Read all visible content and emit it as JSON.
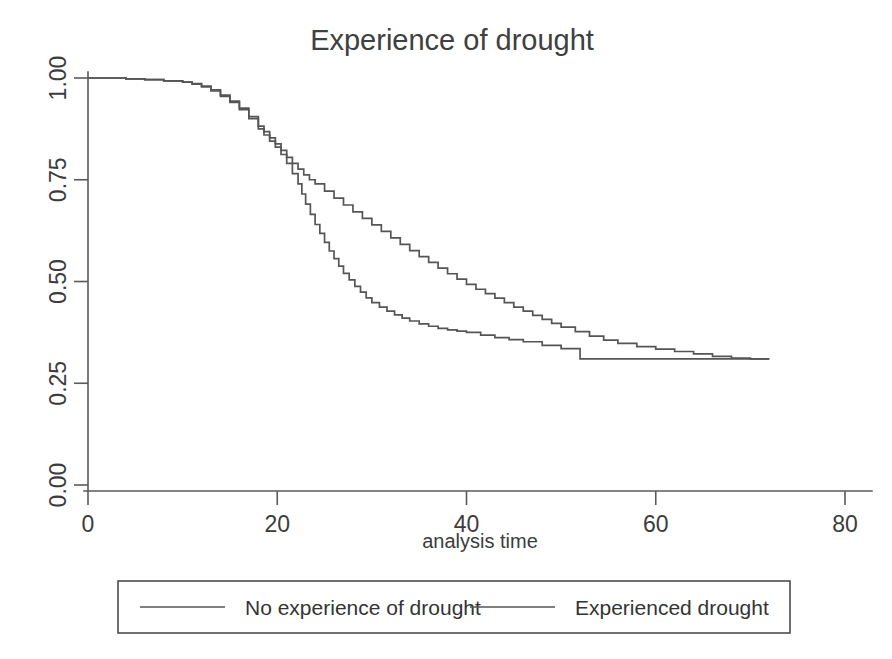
{
  "chart_data": {
    "type": "line",
    "subtype": "kaplan-meier-step",
    "title": "Experience of drought",
    "xlabel": "analysis time",
    "ylabel": "",
    "xlim": [
      0,
      80
    ],
    "ylim": [
      0,
      1.0
    ],
    "xticks": [
      0,
      20,
      40,
      60,
      80
    ],
    "xticklabels": [
      "0",
      "20",
      "40",
      "60",
      "80"
    ],
    "yticks": [
      0.0,
      0.25,
      0.5,
      0.75,
      1.0
    ],
    "yticklabels": [
      "0.00",
      "0.25",
      "0.50",
      "0.75",
      "1.00"
    ],
    "grid": false,
    "legend_position": "below-axes",
    "line_color": "#555555",
    "background_color": "#ffffff",
    "series": [
      {
        "name": "No experience of drought",
        "x": [
          0,
          2,
          4,
          6,
          8,
          10,
          11,
          12,
          13,
          14,
          15,
          16,
          17,
          18,
          18.6,
          19.2,
          19.8,
          20.4,
          21,
          21.6,
          22.2,
          22.6,
          23,
          23.5,
          24,
          24.5,
          25,
          25.5,
          26,
          26.5,
          27,
          27.6,
          28.2,
          28.8,
          29.4,
          30,
          30.8,
          31.6,
          32.4,
          33.2,
          34,
          35,
          36,
          37,
          38,
          39,
          40,
          41.5,
          43,
          44.5,
          46,
          48,
          50,
          52,
          55,
          58,
          62,
          66,
          70,
          72
        ],
        "y": [
          1.0,
          1.0,
          0.998,
          0.996,
          0.993,
          0.99,
          0.985,
          0.978,
          0.968,
          0.955,
          0.94,
          0.922,
          0.9,
          0.875,
          0.86,
          0.845,
          0.83,
          0.812,
          0.79,
          0.765,
          0.74,
          0.715,
          0.69,
          0.665,
          0.64,
          0.618,
          0.596,
          0.575,
          0.556,
          0.538,
          0.52,
          0.504,
          0.488,
          0.474,
          0.46,
          0.448,
          0.437,
          0.427,
          0.418,
          0.41,
          0.403,
          0.396,
          0.39,
          0.385,
          0.381,
          0.378,
          0.375,
          0.368,
          0.362,
          0.357,
          0.352,
          0.343,
          0.335,
          0.31,
          0.31,
          0.31,
          0.31,
          0.31,
          0.31,
          0.31
        ]
      },
      {
        "name": "Experienced drought",
        "x": [
          0,
          2,
          4,
          6,
          8,
          10,
          11,
          12,
          13,
          14,
          15,
          16,
          17,
          18,
          18.6,
          19.2,
          19.8,
          20.4,
          21,
          21.6,
          22.2,
          22.8,
          23.4,
          24,
          25,
          26,
          27,
          28,
          29,
          30,
          31,
          32,
          33,
          34,
          35,
          36,
          37,
          38,
          39,
          40,
          41,
          42,
          43,
          44,
          45,
          46,
          47,
          48,
          49,
          50,
          51.5,
          53,
          54.5,
          56,
          58,
          60,
          62,
          64,
          66,
          68,
          70,
          72
        ],
        "y": [
          1.0,
          1.0,
          0.998,
          0.996,
          0.993,
          0.99,
          0.986,
          0.98,
          0.971,
          0.958,
          0.943,
          0.926,
          0.905,
          0.882,
          0.868,
          0.853,
          0.838,
          0.822,
          0.805,
          0.79,
          0.776,
          0.762,
          0.75,
          0.74,
          0.722,
          0.705,
          0.688,
          0.671,
          0.655,
          0.639,
          0.623,
          0.607,
          0.591,
          0.576,
          0.561,
          0.547,
          0.533,
          0.519,
          0.506,
          0.493,
          0.481,
          0.47,
          0.459,
          0.448,
          0.437,
          0.427,
          0.417,
          0.407,
          0.397,
          0.388,
          0.377,
          0.366,
          0.356,
          0.348,
          0.34,
          0.334,
          0.328,
          0.322,
          0.316,
          0.312,
          0.31,
          0.31
        ]
      }
    ],
    "annotations": []
  },
  "title": {
    "text": "Experience of drought"
  },
  "axes": {
    "x_title": "analysis time",
    "x_tick_labels": [
      "0",
      "20",
      "40",
      "60",
      "80"
    ],
    "y_tick_labels": [
      "0.00",
      "0.25",
      "0.50",
      "0.75",
      "1.00"
    ]
  },
  "legend": {
    "entries": [
      {
        "label": "No experience of drought"
      },
      {
        "label": "Experienced drought"
      }
    ]
  }
}
